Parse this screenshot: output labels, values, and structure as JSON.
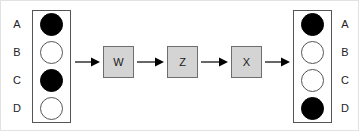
{
  "diagram": {
    "colors": {
      "filled_cell": "#000000",
      "open_cell": "#ffffff",
      "cell_stroke": "#555555",
      "operator_fill": "#d4d4d4",
      "operator_stroke": "#6e6e6e",
      "arrow": "#000000",
      "background": "#ffffff",
      "outer_frame": "#e2e2e2"
    },
    "input_vector": {
      "name": "input-vector",
      "labels": [
        "A",
        "B",
        "C",
        "D"
      ],
      "cells": [
        "filled",
        "open",
        "filled",
        "open"
      ]
    },
    "output_vector": {
      "name": "output-vector",
      "labels": [
        "A",
        "B",
        "C",
        "D"
      ],
      "cells": [
        "filled",
        "open",
        "open",
        "filled"
      ]
    },
    "operators": [
      {
        "label": "W"
      },
      {
        "label": "Z"
      },
      {
        "label": "X"
      }
    ],
    "arrows": [
      {
        "name": "arrow-input-to-w"
      },
      {
        "name": "arrow-w-to-z"
      },
      {
        "name": "arrow-z-to-x"
      },
      {
        "name": "arrow-x-to-output"
      }
    ]
  }
}
